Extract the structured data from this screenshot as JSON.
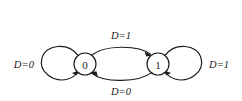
{
  "diagram": {
    "type": "state-transition-diagram",
    "background_color": "#ffffff",
    "line_color": "#1a1a1a",
    "states": [
      {
        "id": "state-0",
        "label": "0",
        "cx": 85,
        "cy": 64,
        "r": 11
      },
      {
        "id": "state-1",
        "label": "1",
        "cx": 158,
        "cy": 64,
        "r": 11
      }
    ],
    "transitions": [
      {
        "id": "self-loop-0",
        "from": "0",
        "to": "0",
        "label": "D=0",
        "position": "left",
        "label_x": 30,
        "label_y": 64
      },
      {
        "id": "transition-0-to-1",
        "from": "0",
        "to": "1",
        "label": "D=1",
        "position": "top",
        "label_x": 121,
        "label_y": 35
      },
      {
        "id": "transition-1-to-0",
        "from": "1",
        "to": "0",
        "label": "D=0",
        "position": "bottom",
        "label_x": 121,
        "label_y": 91
      },
      {
        "id": "self-loop-1",
        "from": "1",
        "to": "1",
        "label": "D=1",
        "position": "right",
        "label_x": 213,
        "label_y": 64
      }
    ]
  }
}
